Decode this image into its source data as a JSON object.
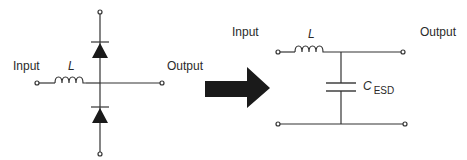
{
  "diagram": {
    "type": "circuit-transformation",
    "colors": {
      "wire": "#333333",
      "fill": "#1a1a1a",
      "text": "#2a2a2a",
      "background": "#ffffff"
    },
    "left_circuit": {
      "input_label": "Input",
      "output_label": "Output",
      "inductor_label": "L",
      "components": [
        "inductor-L",
        "diode-top",
        "diode-bottom"
      ],
      "terminals": 4
    },
    "arrow": {
      "direction": "right",
      "meaning": "equivalent-to"
    },
    "right_circuit": {
      "input_label": "Input",
      "output_label": "Output",
      "inductor_label": "L",
      "capacitor_label": "C",
      "capacitor_subscript": "ESD",
      "components": [
        "inductor-L",
        "capacitor-C-ESD"
      ],
      "terminals": 4
    }
  }
}
